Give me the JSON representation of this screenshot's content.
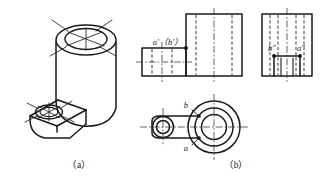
{
  "figure": {
    "background_color": "#ffffff",
    "line_color": "#1a1a1a",
    "hidden_line_color": "#3a3a3a",
    "center_line_color": "#3a3a3a"
  },
  "captions": {
    "left": "（a）",
    "right": "（b）"
  },
  "pictorial_view": {
    "name": "isometric-bracket",
    "description": "Isometric pictorial of an L-shaped bracket: tall vertical cylinder with a coaxial through hole at top, and a lower horizontal arm at left carrying a smaller through hole.",
    "features": [
      "large-cylinder",
      "large-top-hole",
      "lower-arm",
      "small-arm-hole",
      "cylinder-center-lines",
      "small-hole-center-lines"
    ]
  },
  "projection_views": {
    "front_view": {
      "name": "front-view",
      "labels": [
        {
          "id": "a-prime-b-prime",
          "text": "a′（b′）"
        }
      ],
      "markers": [
        {
          "id": "front-point-marker"
        }
      ]
    },
    "side_view": {
      "name": "left-side-view",
      "labels": [
        {
          "id": "b-double-prime",
          "text": "b″"
        },
        {
          "id": "a-double-prime",
          "text": "a″"
        }
      ],
      "markers": [
        {
          "id": "side-point-marker-b"
        },
        {
          "id": "side-point-marker-a"
        }
      ]
    },
    "top_view": {
      "name": "top-view",
      "labels": [
        {
          "id": "b-point",
          "text": "b"
        },
        {
          "id": "a-point",
          "text": "a"
        }
      ],
      "markers": [
        {
          "id": "top-point-marker-b"
        },
        {
          "id": "top-point-marker-a"
        }
      ]
    }
  }
}
